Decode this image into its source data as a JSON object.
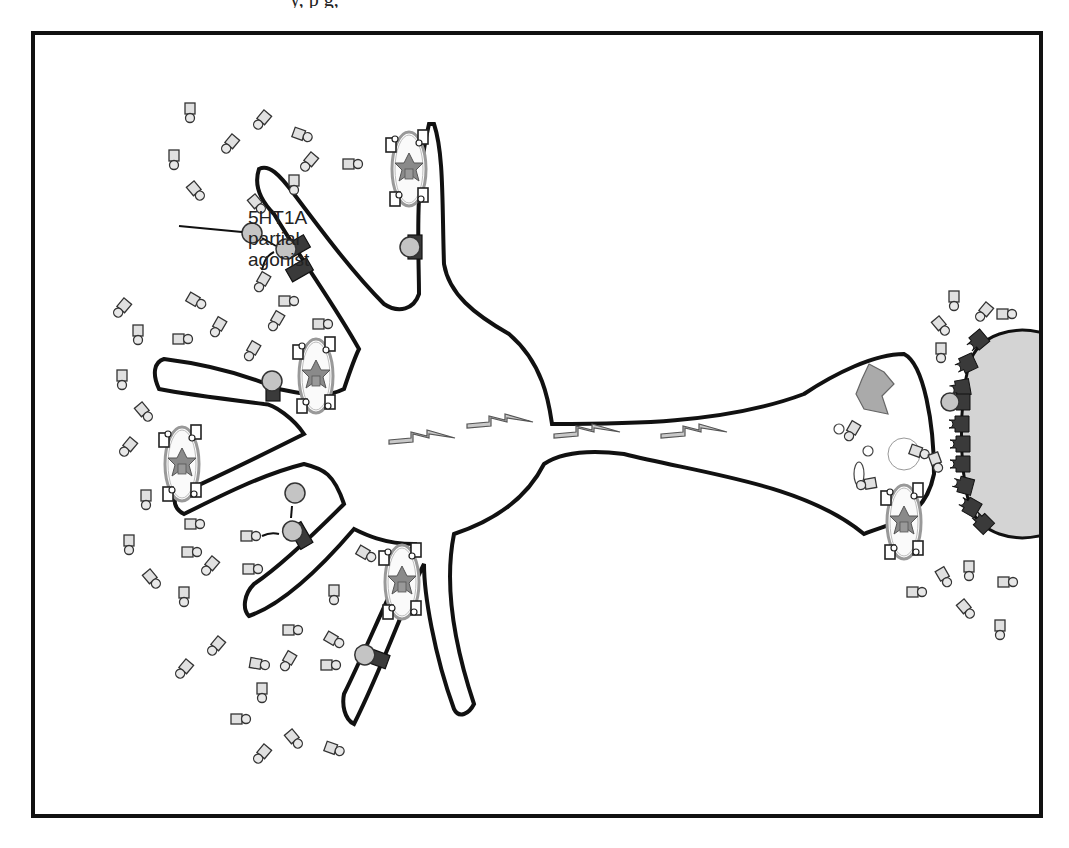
{
  "figure": {
    "top_caption_fragment": "y, p       g,",
    "annotation": {
      "line1": "5HT1A",
      "line2": "partial",
      "line3": "agonist"
    }
  },
  "elements": {
    "neuron": "serotonin neuron with soma, dendrites and axon",
    "axon_impulses": 4,
    "somatodendritic_autoreceptors": "5HT1A receptors on dendrites",
    "postsynaptic_cell": "target neuron with receptors",
    "vesicles": "vesicles with serotonin transporter/enzymes"
  },
  "colors": {
    "outline": "#111111",
    "receptor": "#3a3a3a",
    "ligand": "#bdbdbd",
    "serotonin_body": "#d8d8d8",
    "postsynaptic_fill": "#d4d4d4",
    "enzyme": "#8a8a8a",
    "impulse": "#c8c8c8"
  }
}
